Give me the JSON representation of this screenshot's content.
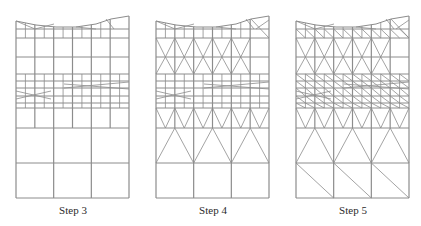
{
  "figure": {
    "panels": [
      {
        "id": "step3",
        "label": "Step 3",
        "x0": 16,
        "label_center": 73
      },
      {
        "id": "step4",
        "label": "Step 4",
        "x0": 156,
        "label_center": 213
      },
      {
        "id": "step5",
        "label": "Step 5",
        "x0": 296,
        "label_center": 353
      }
    ],
    "geometry": {
      "width": 113,
      "columns": 6,
      "fine_columns": 12,
      "rows_y": [
        29,
        38,
        57,
        74,
        81,
        88,
        96,
        103,
        108,
        128,
        163,
        198
      ],
      "top_curve": [
        [
          0,
          21
        ],
        [
          20,
          25
        ],
        [
          40,
          27
        ],
        [
          60,
          27
        ],
        [
          80,
          24
        ],
        [
          95,
          19
        ],
        [
          113,
          16
        ]
      ],
      "bottom_y": 198
    },
    "colors": {
      "line": "#8c8c8c",
      "background": "#ffffff",
      "text": "#2a2a2a"
    }
  }
}
